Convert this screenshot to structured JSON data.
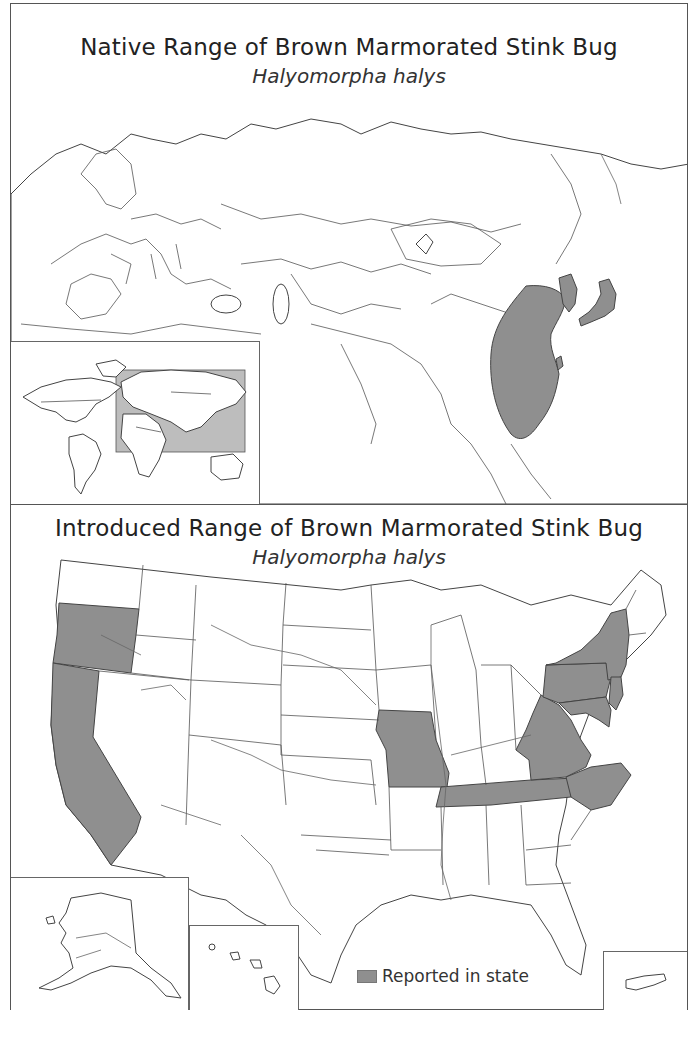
{
  "native_map": {
    "title": "Native Range of Brown Marmorated Stink Bug",
    "subtitle": "Halyomorpha halys",
    "range_regions": [
      "Eastern China",
      "Korea",
      "Japan",
      "Taiwan"
    ],
    "inset": {
      "label": "World locator map",
      "highlight": "Eurasia extent"
    }
  },
  "introduced_map": {
    "title": "Introduced Range of Brown Marmorated Stink Bug",
    "subtitle": "Halyomorpha halys",
    "reported_states": [
      "Oregon",
      "California",
      "Missouri",
      "Tennessee",
      "Virginia",
      "West Virginia",
      "North Carolina",
      "Pennsylvania",
      "New York",
      "New Jersey",
      "Maryland",
      "Delaware"
    ],
    "insets": [
      "Alaska",
      "Hawaii",
      "Puerto Rico"
    ]
  },
  "legend": {
    "label": "Reported in state",
    "color": "#8f8f8f"
  },
  "colors": {
    "range_fill": "#8f8f8f",
    "outline": "#444444",
    "background": "#ffffff"
  }
}
